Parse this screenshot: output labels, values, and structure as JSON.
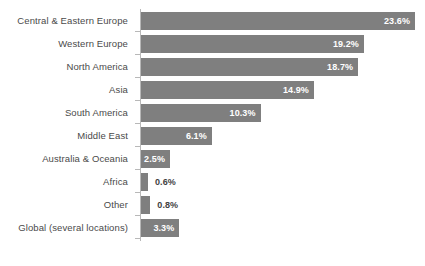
{
  "chart_data": {
    "type": "bar",
    "orientation": "horizontal",
    "title": "",
    "subtitle": "",
    "xlabel": "",
    "ylabel": "",
    "grid": false,
    "legend": false,
    "legend_position": "none",
    "value_suffix": "%",
    "xlim": [
      0,
      23.6
    ],
    "bar_color": "#7f7f7f",
    "axis_color": "#b8b8b8",
    "label_color": "#4a4a4a",
    "inside_label_color": "#ffffff",
    "outside_label_color": "#3f3f3f",
    "categories": [
      "Central & Eastern Europe",
      "Western Europe",
      "North America",
      "Asia",
      "South America",
      "Middle East",
      "Australia & Oceania",
      "Africa",
      "Other",
      "Global (several locations)"
    ],
    "values": [
      23.6,
      19.2,
      18.7,
      14.9,
      10.3,
      6.1,
      2.5,
      0.6,
      0.8,
      3.3
    ],
    "value_labels": [
      "23.6%",
      "19.2%",
      "18.7%",
      "14.9%",
      "10.3%",
      "6.1%",
      "2.5%",
      "0.6%",
      "0.8%",
      "3.3%"
    ],
    "label_placement": [
      "inside",
      "inside",
      "inside",
      "inside",
      "inside",
      "inside",
      "inside",
      "outside",
      "outside",
      "inside"
    ]
  }
}
